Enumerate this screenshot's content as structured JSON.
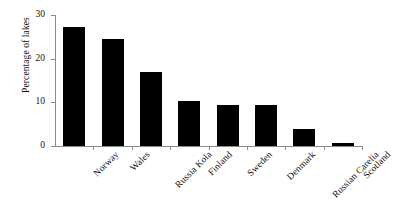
{
  "chart_data": {
    "type": "bar",
    "title": "",
    "subtitle": "",
    "xlabel": "",
    "ylabel": "Percentage of lakes",
    "categories": [
      "Norway",
      "Wales",
      "Russia Kola",
      "Finland",
      "Sweden",
      "Denmark",
      "Russian Carelia",
      "Scotland"
    ],
    "values": [
      27.2,
      24.5,
      16.9,
      10.3,
      9.4,
      9.3,
      3.9,
      0.7
    ],
    "ylim": [
      0,
      30
    ],
    "yticks": [
      0,
      10,
      20,
      30
    ],
    "ytick_labels": [
      "0",
      "10",
      "20",
      "30"
    ],
    "grid": false,
    "legend": false,
    "legend_position": "none",
    "bar_color": "#000000",
    "axis_color": "#8a8a8a",
    "background_color": "#ffffff"
  },
  "axis": {
    "y_title": "Percentage of lakes",
    "tick_0": "0",
    "tick_10": "10",
    "tick_20": "20",
    "tick_30": "30"
  },
  "categories": {
    "c0": "Norway",
    "c1": "Wales",
    "c2": "Russia Kola",
    "c3": "Finland",
    "c4": "Sweden",
    "c5": "Denmark",
    "c6": "Russian Carelia",
    "c7": "Scotland"
  }
}
